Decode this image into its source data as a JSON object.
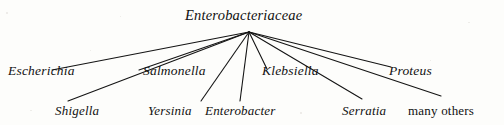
{
  "diagram": {
    "type": "radial-tree",
    "title": "Enterobacteriaceae",
    "root": {
      "label": "Enterobacteriaceae",
      "italic": true,
      "x": 249,
      "y": 32
    },
    "children": [
      {
        "label": "Escherichia",
        "italic": true,
        "tier": "upper",
        "label_x": 8,
        "label_y": 64,
        "edge_end_x": 52,
        "edge_end_y": 70
      },
      {
        "label": "Shigella",
        "italic": true,
        "tier": "lower",
        "label_x": 55,
        "label_y": 104,
        "edge_end_x": 68,
        "edge_end_y": 101
      },
      {
        "label": "Salmonella",
        "italic": true,
        "tier": "upper",
        "label_x": 143,
        "label_y": 64,
        "edge_end_x": 139,
        "edge_end_y": 70
      },
      {
        "label": "Yersinia",
        "italic": true,
        "tier": "lower",
        "label_x": 148,
        "label_y": 104,
        "edge_end_x": 201,
        "edge_end_y": 101
      },
      {
        "label": "Enterobacter",
        "italic": true,
        "tier": "lower",
        "label_x": 205,
        "label_y": 104,
        "edge_end_x": 240,
        "edge_end_y": 101
      },
      {
        "label": "Klebsiella",
        "italic": true,
        "tier": "upper",
        "label_x": 262,
        "label_y": 64,
        "edge_end_x": 267,
        "edge_end_y": 69
      },
      {
        "label": "Serratia",
        "italic": true,
        "tier": "lower",
        "label_x": 342,
        "label_y": 104,
        "edge_end_x": 362,
        "edge_end_y": 99
      },
      {
        "label": "Proteus",
        "italic": true,
        "tier": "upper",
        "label_x": 389,
        "label_y": 64,
        "edge_end_x": 391,
        "edge_end_y": 67
      },
      {
        "label": "many others",
        "italic": false,
        "tier": "lower",
        "label_x": 408,
        "label_y": 104,
        "edge_end_x": 441,
        "edge_end_y": 96
      }
    ],
    "colors": {
      "background": "#fdfdfb",
      "edge": "#141414",
      "text": "#111111"
    },
    "edge_width": 1.1
  }
}
